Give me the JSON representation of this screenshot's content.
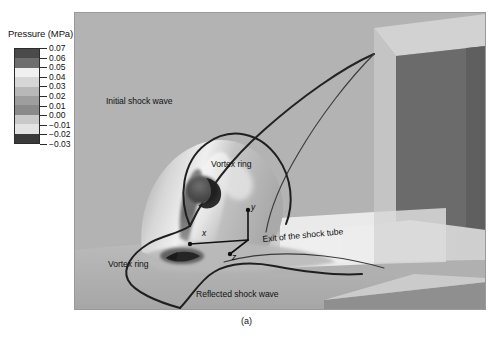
{
  "figure": {
    "caption": "(a)",
    "panel_background": "#b3b3b3"
  },
  "legend": {
    "title": "Pressure (MPa)",
    "unit": "MPa",
    "quantity": "Pressure",
    "tick_labels": [
      "0.07",
      "0.06",
      "0.05",
      "0.04",
      "0.03",
      "0.02",
      "0.01",
      "0.00",
      "−0.01",
      "−0.02",
      "−0.03"
    ],
    "band_colors": [
      "#4a4a4a",
      "#6e6e6e",
      "#f0f0f0",
      "#d6d6d6",
      "#b8b8b8",
      "#9e9e9e",
      "#8a8a8a",
      "#c9c9c9",
      "#e3e3e3",
      "#3a3a3a"
    ],
    "border_color": "#2b2b2b"
  },
  "annotations": {
    "initial_shock_wave": "Initial shock wave",
    "vortex_ring_upper": "Vortex ring",
    "vortex_ring_lower": "Vortex ring",
    "reflected_shock_wave": "Reflected shock wave",
    "exit_of_shock_tube": "Exit of the shock tube"
  },
  "axes_triad": {
    "x_label": "x",
    "y_label": "y",
    "z_label": "z"
  },
  "chart_data": {
    "type": "heatmap",
    "title": "",
    "subtitle": "",
    "xlabel": "",
    "ylabel": "",
    "colorbar": {
      "label": "Pressure (MPa)",
      "ticks": [
        0.07,
        0.06,
        0.05,
        0.04,
        0.03,
        0.02,
        0.01,
        0.0,
        -0.01,
        -0.02,
        -0.03
      ],
      "range": [
        -0.03,
        0.07
      ],
      "colormap": "grayscale-banded",
      "n_bands": 10
    },
    "features": [
      {
        "name": "Initial shock wave",
        "kind": "contour-front",
        "label_xy": [
          106,
          93
        ]
      },
      {
        "name": "Vortex ring",
        "kind": "toroidal-structure",
        "label_xy": [
          211,
          157
        ]
      },
      {
        "name": "Vortex ring",
        "kind": "toroidal-structure",
        "label_xy": [
          108,
          258
        ]
      },
      {
        "name": "Reflected shock wave",
        "kind": "contour-front",
        "label_xy": [
          196,
          287
        ]
      },
      {
        "name": "Exit of the shock tube",
        "kind": "geometry-boundary",
        "label_xy": [
          262,
          239
        ]
      }
    ],
    "grid": false,
    "legend_position": "outside-left"
  }
}
